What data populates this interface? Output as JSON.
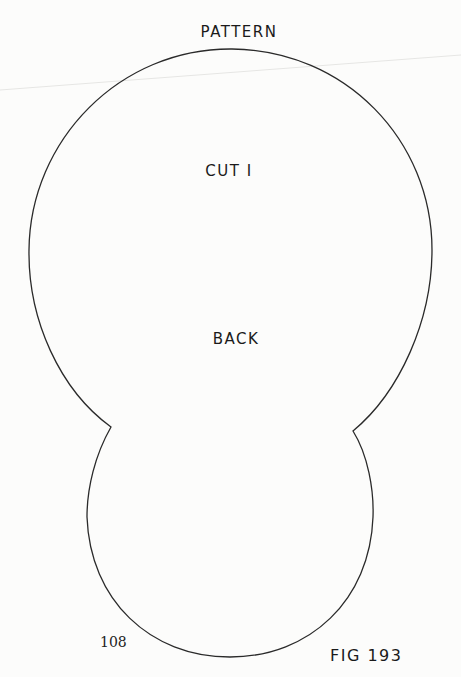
{
  "pattern": {
    "title": "PATTERN",
    "instruction": "CUT I",
    "piece_name": "BACK"
  },
  "footer": {
    "page_number": "108",
    "figure_label": "FIG 193"
  },
  "colors": {
    "outline": "#2a2a2a",
    "paper": "#fcfcfb",
    "text": "#1a1a1a"
  }
}
